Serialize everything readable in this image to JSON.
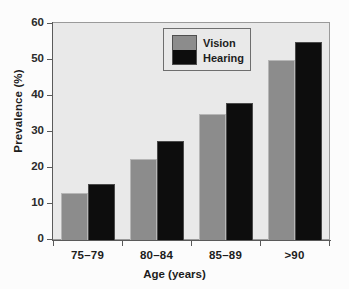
{
  "chart_data": {
    "type": "bar",
    "title": "",
    "xlabel": "Age (years)",
    "ylabel": "Prevalence (%)",
    "categories": [
      "75–79",
      "80–84",
      "85–89",
      ">90"
    ],
    "series": [
      {
        "name": "Vision",
        "color": "#8c8c8c",
        "values": [
          13,
          22.5,
          35,
          50
        ]
      },
      {
        "name": "Hearing",
        "color": "#0d0d0d",
        "values": [
          15.5,
          27.5,
          38,
          55
        ]
      }
    ],
    "ylim": [
      0,
      60
    ],
    "ytick_values": [
      0,
      10,
      20,
      30,
      40,
      50,
      60
    ],
    "ytick_labels": [
      "0",
      "10",
      "20",
      "30",
      "40",
      "50",
      "60"
    ],
    "grid": false,
    "legend_position": "top-center",
    "plot_background": "#e9e9e9",
    "figure_background": "#fcfcfc"
  },
  "legend": {
    "entries": [
      {
        "label": "Vision"
      },
      {
        "label": "Hearing"
      }
    ]
  }
}
